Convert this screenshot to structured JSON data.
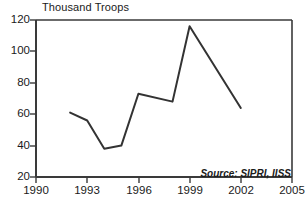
{
  "chart_data": {
    "type": "line",
    "title": "Thousand Troops",
    "xlabel": "",
    "ylabel": "Thousand Troops",
    "xlim": [
      1990,
      2005
    ],
    "ylim": [
      20,
      120
    ],
    "grid": false,
    "legend": null,
    "annotations": [
      {
        "name": "source",
        "text": "Source: SIPRI, IISS"
      }
    ],
    "xticks": [
      "1990",
      "1993",
      "1996",
      "1999",
      "2002",
      "2005"
    ],
    "xtick_values": [
      1990,
      1993,
      1996,
      1999,
      2002,
      2005
    ],
    "yticks": [
      "20",
      "40",
      "60",
      "80",
      "100",
      "120"
    ],
    "ytick_values": [
      20,
      40,
      60,
      80,
      100,
      120
    ],
    "series": [
      {
        "name": "Troops",
        "color": "#333333",
        "x": [
          1992,
          1993,
          1994,
          1995,
          1996,
          1998,
          1999,
          2002
        ],
        "values": [
          61,
          56,
          38,
          40,
          73,
          68,
          116,
          64
        ]
      }
    ]
  },
  "axis_title": "Thousand Troops",
  "source": "Source: SIPRI, IISS",
  "colors": {
    "line": "#333333",
    "axis": "#3a3a3a",
    "text": "#1a1a1a",
    "background": "#ffffff"
  }
}
